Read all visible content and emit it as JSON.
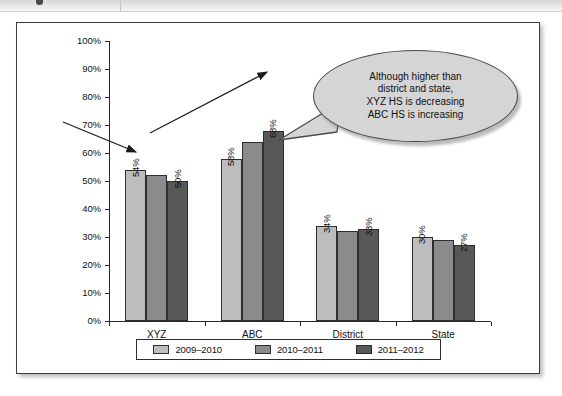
{
  "figure": {
    "top_band": {
      "icon": "cut-off-toolbar-strip"
    }
  },
  "chart_data": {
    "type": "bar",
    "title": "",
    "xlabel": "",
    "ylabel": "",
    "ylim": [
      0,
      100
    ],
    "ytick_labels": [
      "0%",
      "10%",
      "20%",
      "30%",
      "40%",
      "50%",
      "60%",
      "70%",
      "80%",
      "90%",
      "100%"
    ],
    "ytick_values": [
      0,
      10,
      20,
      30,
      40,
      50,
      60,
      70,
      80,
      90,
      100
    ],
    "grid": false,
    "legend_position": "bottom",
    "categories": [
      "XYZ",
      "ABC",
      "District",
      "State"
    ],
    "series": [
      {
        "name": "2009–2010",
        "color": "#bdbdbd",
        "values": [
          54,
          58,
          34,
          30
        ],
        "labels": [
          "54%",
          "58%",
          "34%",
          "30%"
        ]
      },
      {
        "name": "2010–2011",
        "color": "#8b8b8b",
        "values": [
          52,
          64,
          32,
          29
        ],
        "labels": [
          "",
          "",
          "",
          ""
        ]
      },
      {
        "name": "2011–2012",
        "color": "#585858",
        "values": [
          50,
          68,
          33,
          27
        ],
        "labels": [
          "50%",
          "68%",
          "33%",
          "27%"
        ]
      }
    ],
    "annotations": [
      {
        "name": "xyz-decreasing-arrow",
        "kind": "arrow",
        "direction": "down-right",
        "meaning": "XYZ HS is decreasing"
      },
      {
        "name": "abc-increasing-arrow",
        "kind": "arrow",
        "direction": "up-right",
        "meaning": "ABC HS is increasing"
      },
      {
        "name": "callout-bubble",
        "kind": "callout",
        "lines": [
          "Although higher than",
          "district and state,",
          "XYZ HS is decreasing",
          "ABC HS is increasing"
        ],
        "fill": "#d5d5d5"
      }
    ]
  }
}
